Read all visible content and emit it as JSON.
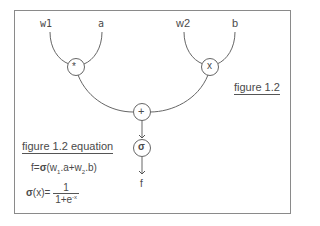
{
  "diagram": {
    "inputs": [
      {
        "id": "w1",
        "label": "w1"
      },
      {
        "id": "a",
        "label": "a"
      },
      {
        "id": "w2",
        "label": "w2"
      },
      {
        "id": "b",
        "label": "b"
      }
    ],
    "nodes": [
      {
        "id": "mul1",
        "symbol": "*"
      },
      {
        "id": "mul2",
        "symbol": "x"
      },
      {
        "id": "add",
        "symbol": "+"
      },
      {
        "id": "sigmoid",
        "symbol": "σ"
      }
    ],
    "output": {
      "label": "f"
    },
    "edges": [
      [
        "w1",
        "mul1"
      ],
      [
        "a",
        "mul1"
      ],
      [
        "w2",
        "mul2"
      ],
      [
        "b",
        "mul2"
      ],
      [
        "mul1",
        "add"
      ],
      [
        "mul2",
        "add"
      ],
      [
        "add",
        "sigmoid"
      ],
      [
        "sigmoid",
        "f"
      ]
    ],
    "stroke_color": "#555555"
  },
  "captions": {
    "figure": "figure 1.2",
    "equation_title": "figure 1.2 equation"
  },
  "equations": {
    "f_lhs": "f=",
    "f_sigma": "σ",
    "f_open": "(w",
    "f_sub1": "1",
    "f_mid": ".a+w",
    "f_sub2": "2",
    "f_close": ".b)",
    "sig_sigma": "σ",
    "sig_lhs": "(x)=",
    "sig_num": "1",
    "sig_den": "1+e",
    "sig_exp": "-x"
  }
}
